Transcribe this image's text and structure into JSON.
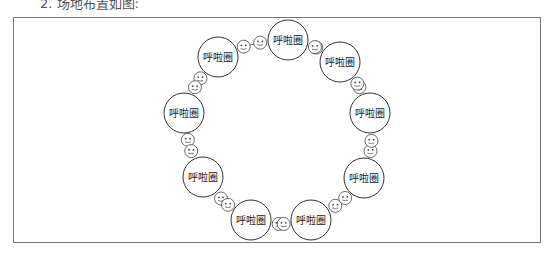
{
  "caption": "2. 场地布置如图:",
  "diagram": {
    "type": "ring-layout",
    "station_label": "呼啦圈",
    "station_count": 9,
    "person_icon": "smiley-face-icon",
    "persons_between_stations": 2,
    "colors": {
      "stroke": "#333333",
      "background": "#ffffff",
      "frame": "#777777"
    }
  }
}
